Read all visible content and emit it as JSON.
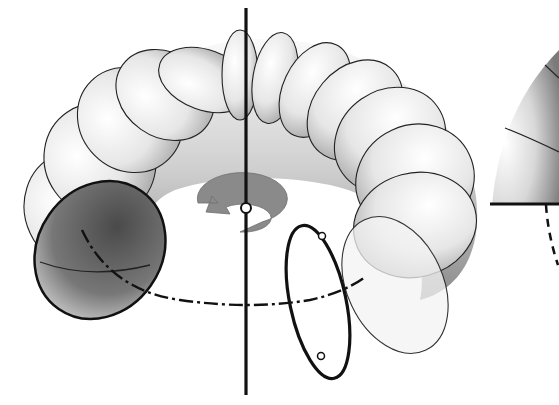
{
  "figure": {
    "elements": {
      "axis": "vertical rotation axis",
      "rotation_arrow": "circular arrow around axis",
      "generating_circle": "circle with two marked points",
      "path_of_center": "dash-dot circular path",
      "partial_sphere": "hemisphere cut off at right edge"
    },
    "colors": {
      "stroke": "#111111",
      "arrow": "#8a8a8a",
      "surface_light": "#f4f4f4",
      "surface_dark": "#5a5a5a"
    }
  }
}
